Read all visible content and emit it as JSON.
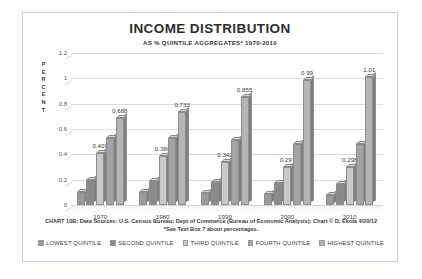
{
  "chart_data": {
    "type": "bar",
    "title": "INCOME DISTRIBUTION",
    "subtitle": "AS % QUINTILE AGGREGATES* 1970-2010",
    "xlabel": "",
    "ylabel": "PERCENT",
    "ylim": [
      0,
      1.2
    ],
    "ytick_labels": [
      "1.2",
      "1",
      "0.8",
      "0.6",
      "0.4",
      "0.2",
      "0"
    ],
    "ytick_values": [
      1.2,
      1,
      0.8,
      0.6,
      0.4,
      0.2,
      0
    ],
    "grid": true,
    "legend_position": "bottom",
    "categories": [
      "1970",
      "1980",
      "1990",
      "2000",
      "2010"
    ],
    "series": [
      {
        "name": "LOWEST QUINTILE",
        "color": "#9a9a9a",
        "values": [
          0.103,
          0.101,
          0.093,
          0.086,
          0.083
        ],
        "labels": [
          "",
          "",
          "",
          "",
          ""
        ]
      },
      {
        "name": "SECOND QUINTILE",
        "color": "#8a8a8a",
        "values": [
          0.198,
          0.193,
          0.182,
          0.17,
          0.167
        ],
        "labels": [
          "",
          "",
          "",
          "",
          ""
        ]
      },
      {
        "name": "THIRD QUINTILE",
        "color": "#c9c9c9",
        "values": [
          0.409,
          0.388,
          0.342,
          0.297,
          0.298
        ],
        "labels": [
          "0.409",
          "0.388",
          "0.342",
          "0.297",
          "0.298"
        ]
      },
      {
        "name": "FOURTH QUINTILE",
        "color": "#a3a3a3",
        "values": [
          0.529,
          0.529,
          0.512,
          0.482,
          0.48
        ],
        "labels": [
          "",
          "",
          "",
          "",
          ""
        ]
      },
      {
        "name": "HIGHEST QUINTILE",
        "color": "#b5b5b5",
        "values": [
          0.688,
          0.733,
          0.855,
          0.99,
          1.01
        ],
        "labels": [
          "0.688",
          "0.733",
          "0.855",
          "0.99",
          "1.01"
        ]
      }
    ],
    "footnote": "CHART 10B; Data Sources: U.S. Census Bureau; Dept of Commerce (Bureau of Economic Analysis); Chart © D. Ekola 4/20/12 *See Text Box 7 about percentages."
  },
  "axis_letters": [
    "P",
    "E",
    "R",
    "C",
    "E",
    "N",
    "T"
  ]
}
